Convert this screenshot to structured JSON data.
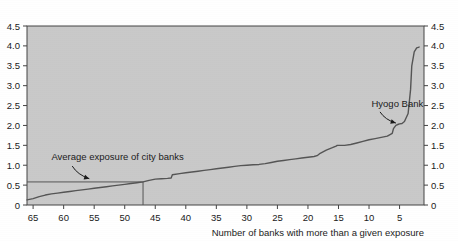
{
  "chart_data": {
    "type": "line",
    "title": "",
    "xlabel": "Number of banks with more than a given exposure",
    "ylabel": "",
    "xticks": [
      65,
      60,
      55,
      50,
      45,
      40,
      35,
      30,
      25,
      20,
      15,
      10,
      5
    ],
    "xtick_labels": [
      "65",
      "60",
      "55",
      "50",
      "45",
      "40",
      "35",
      "30",
      "25",
      "20",
      "15",
      "10",
      "5"
    ],
    "xlim": [
      66,
      1
    ],
    "x_axis_reversed": true,
    "yticks": [
      0,
      0.5,
      1.0,
      1.5,
      2.0,
      2.5,
      3.0,
      3.5,
      4.0,
      4.5
    ],
    "ytick_labels": [
      "0",
      "0.5",
      "1.0",
      "1.5",
      "2.0",
      "2.5",
      "3.0",
      "3.5",
      "4.0",
      "4.5"
    ],
    "ylim": [
      0,
      4.5
    ],
    "grid": false,
    "legend": "none",
    "left_axis_labels": [
      "4.5",
      "4.0",
      "3.5",
      "3.0",
      "2.5",
      "2.0",
      "1.5",
      "1.0",
      "0.5",
      "0"
    ],
    "right_axis_labels": [
      "4.5",
      "4.0",
      "3.5",
      "3.0",
      "2.5",
      "2.0",
      "1.5",
      "1.0",
      "0.5",
      "0"
    ],
    "plot_background_color": "#c9c9c9",
    "line_color": "#555555",
    "axis_color": "#444444",
    "series": [
      {
        "name": "Bank exposure (sorted)",
        "x": [
          66,
          65,
          64,
          63,
          62,
          61,
          60,
          59,
          58,
          57,
          56,
          55,
          54,
          53,
          52,
          51,
          50,
          49,
          48,
          47,
          46,
          45,
          44,
          43,
          42.4,
          42.2,
          41,
          40,
          39,
          38,
          37,
          36,
          35,
          34,
          33,
          32,
          31,
          30,
          29,
          28,
          27,
          26,
          25,
          24,
          23,
          22,
          21,
          20,
          19,
          18.5,
          18,
          17,
          16,
          15.4,
          15.2,
          14,
          13,
          12,
          11,
          10,
          9,
          8,
          7,
          6.2,
          6,
          5.6,
          5.2,
          5,
          4.6,
          4.2,
          3.6,
          3.2,
          3.0,
          2.6,
          2.2,
          1.8
        ],
        "y": [
          0.13,
          0.16,
          0.21,
          0.25,
          0.28,
          0.3,
          0.32,
          0.34,
          0.36,
          0.38,
          0.4,
          0.42,
          0.44,
          0.46,
          0.48,
          0.5,
          0.52,
          0.54,
          0.56,
          0.58,
          0.62,
          0.65,
          0.66,
          0.67,
          0.68,
          0.76,
          0.79,
          0.81,
          0.83,
          0.85,
          0.87,
          0.89,
          0.91,
          0.93,
          0.95,
          0.97,
          0.99,
          1.0,
          1.01,
          1.02,
          1.04,
          1.07,
          1.1,
          1.12,
          1.14,
          1.16,
          1.18,
          1.2,
          1.22,
          1.24,
          1.3,
          1.38,
          1.44,
          1.48,
          1.5,
          1.5,
          1.52,
          1.56,
          1.6,
          1.64,
          1.67,
          1.7,
          1.73,
          1.8,
          1.92,
          2.0,
          2.03,
          2.04,
          2.05,
          2.1,
          2.3,
          2.9,
          3.5,
          3.85,
          3.95,
          3.97
        ]
      }
    ],
    "reference_lines": [
      {
        "name": "average-exposure-line",
        "orientation": "horizontal",
        "y": 0.58,
        "x_from": 66,
        "x_to": 47
      },
      {
        "name": "average-exposure-drop-line",
        "orientation": "vertical",
        "x": 47,
        "y_from": 0,
        "y_to": 0.58
      }
    ],
    "annotations": [
      {
        "id": "average-exposure-annotation",
        "text": "Average exposure of city banks",
        "text_x": 62.0,
        "text_y": 1.12,
        "arrow_from_x": 58.6,
        "arrow_from_y": 0.98,
        "arrow_to_x": 55.8,
        "arrow_to_y": 0.66
      },
      {
        "id": "hyogo-bank-annotation",
        "text": "Hyogo Bank",
        "text_x": 9.6,
        "text_y": 2.46,
        "arrow_from_x": 8.2,
        "arrow_from_y": 2.34,
        "arrow_to_x": 5.6,
        "arrow_to_y": 2.06
      }
    ]
  }
}
